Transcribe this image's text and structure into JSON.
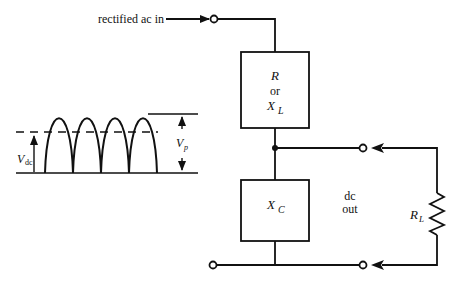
{
  "diagram": {
    "title": "",
    "labels": {
      "input": "rectified ac in",
      "series_element_line1": "R",
      "series_element_line2": "or",
      "series_element_line3_main": "X",
      "series_element_line3_sub": "L",
      "shunt_element_main": "X",
      "shunt_element_sub": "C",
      "output_line1": "dc",
      "output_line2": "out",
      "load_main": "R",
      "load_sub": "L",
      "vdc_main": "V",
      "vdc_sub": "dc",
      "vp_main": "V",
      "vp_sub": "p"
    },
    "components": [
      {
        "id": "series",
        "type": "box",
        "label": "R or XL"
      },
      {
        "id": "shunt",
        "type": "box",
        "label": "XC"
      },
      {
        "id": "load",
        "type": "resistor",
        "label": "RL"
      }
    ],
    "terminals": [
      "input-top",
      "input-bottom",
      "output-top",
      "output-bottom"
    ],
    "waveform": {
      "type": "full-wave rectified",
      "pulses": 4,
      "annotations": [
        "Vdc",
        "Vp"
      ]
    },
    "colors": {
      "ink": "#111111",
      "background": "#ffffff"
    }
  }
}
